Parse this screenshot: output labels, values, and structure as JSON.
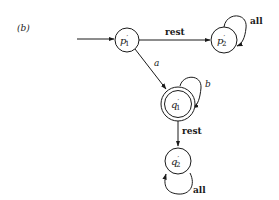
{
  "figure": {
    "panel_label": "(b)",
    "colors": {
      "stroke": "#1a1a1a",
      "background": "#ffffff"
    }
  },
  "states": [
    {
      "id": "p1",
      "name": "p",
      "prime": "′",
      "sub": "1",
      "start": true,
      "accepting": false
    },
    {
      "id": "p2",
      "name": "p",
      "prime": "′",
      "sub": "2",
      "start": false,
      "accepting": false
    },
    {
      "id": "q1",
      "name": "q",
      "prime": "′",
      "sub": "1",
      "start": false,
      "accepting": true
    },
    {
      "id": "q2",
      "name": "q",
      "prime": "′",
      "sub": "2",
      "start": false,
      "accepting": false
    }
  ],
  "transitions": [
    {
      "from": "p1",
      "to": "p2",
      "label": "rest"
    },
    {
      "from": "p2",
      "to": "p2",
      "label": "all"
    },
    {
      "from": "p1",
      "to": "q1",
      "label": "a"
    },
    {
      "from": "q1",
      "to": "q1",
      "label": "b"
    },
    {
      "from": "q1",
      "to": "q2",
      "label": "rest"
    },
    {
      "from": "q2",
      "to": "q2",
      "label": "all"
    }
  ]
}
